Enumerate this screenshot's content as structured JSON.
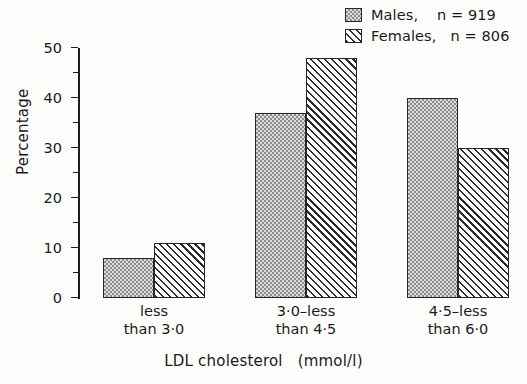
{
  "chart_data": {
    "type": "bar",
    "title": "",
    "xlabel": "LDL cholesterol   (mmol/l)",
    "ylabel": "Percentage",
    "categories": [
      "less\nthan 3·0",
      "3·0–less\nthan 4·5",
      "4·5–less\nthan 6·0",
      "6·0 or\nmore"
    ],
    "series": [
      {
        "name": "Males",
        "n": 919,
        "values": [
          8,
          37,
          40,
          15
        ],
        "fill": "dotted-stipple"
      },
      {
        "name": "Females",
        "n": 806,
        "values": [
          11,
          48,
          30,
          11
        ],
        "fill": "diagonal-hatch"
      }
    ],
    "ylim": [
      0,
      50
    ],
    "yticks": [
      0,
      10,
      20,
      30,
      40,
      50
    ],
    "yticks_minor": [
      5,
      15,
      25,
      35,
      45
    ],
    "grid": false,
    "legend_position": "top-right"
  },
  "legend": {
    "items": [
      {
        "label": "Males,    n = 919",
        "fill": "dotted-stipple"
      },
      {
        "label": "Females,   n = 806",
        "fill": "diagonal-hatch"
      }
    ]
  },
  "colors": {
    "axis": "#1f1f1f",
    "bar_outline": "#262626",
    "males_fill": "#dcdcdc",
    "females_fill": "#ffffff",
    "background": "#fdfdfb"
  }
}
